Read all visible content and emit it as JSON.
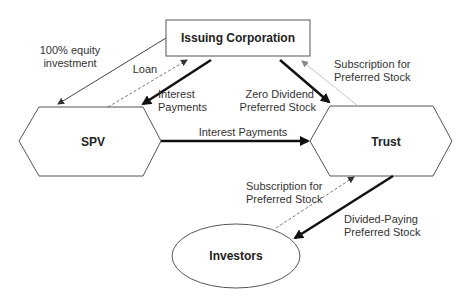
{
  "nodes": {
    "issuing_corporation": "Issuing Corporation",
    "spv": "SPV",
    "trust": "Trust",
    "investors": "Investors"
  },
  "edges": {
    "equity_investment": {
      "line1": "100% equity",
      "line2": "investment"
    },
    "loan": {
      "line1": "Loan"
    },
    "interest_payments_corp": {
      "line1": "Interest",
      "line2": "Payments"
    },
    "interest_payments_spv_trust": {
      "line1": "Interest Payments"
    },
    "zero_dividend": {
      "line1": "Zero Dividend",
      "line2": "Preferred Stock"
    },
    "subscription_corp": {
      "line1": "Subscription for",
      "line2": "Preferred Stock"
    },
    "subscription_investors": {
      "line1": "Subscription for",
      "line2": "Preferred Stock"
    },
    "dividend_paying": {
      "line1": "Divided-Paying",
      "line2": "Preferred Stock"
    }
  },
  "colors": {
    "stroke": "#555555",
    "heavy": "#111111",
    "light": "#c8c8c8",
    "text": "#333333"
  }
}
